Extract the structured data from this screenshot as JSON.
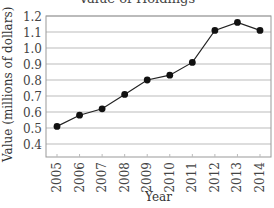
{
  "chart_data": {
    "type": "line",
    "title": "Value of Holdings",
    "xlabel": "Year",
    "ylabel": "Value (millions of dollars)",
    "categories": [
      "2005",
      "2006",
      "2007",
      "2008",
      "2009",
      "2010",
      "2011",
      "2012",
      "2013",
      "2014"
    ],
    "values": [
      0.51,
      0.58,
      0.62,
      0.71,
      0.8,
      0.83,
      0.91,
      1.11,
      1.16,
      1.11
    ],
    "yticks": [
      "1.2",
      "1.1",
      "1.0",
      "0.9",
      "0.8",
      "0.7",
      "0.6",
      "0.5",
      "0.4"
    ],
    "ylim": [
      0.33,
      1.2
    ],
    "grid": true,
    "legend": null,
    "marker": "filled-circle",
    "line_color": "#222222",
    "grid_color": "#bbbbbb"
  }
}
